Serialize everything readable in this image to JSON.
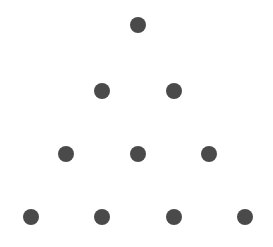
{
  "diagram": {
    "type": "triangular-dot-pattern",
    "rows": 4,
    "total_dots": 10,
    "dot_color": "#4a4a4a",
    "background": "#ffffff",
    "dot_diameter": 16,
    "dots": [
      {
        "row": 1,
        "x": 138,
        "y": 25
      },
      {
        "row": 2,
        "x": 102,
        "y": 91
      },
      {
        "row": 2,
        "x": 174,
        "y": 91
      },
      {
        "row": 3,
        "x": 66,
        "y": 154
      },
      {
        "row": 3,
        "x": 138,
        "y": 154
      },
      {
        "row": 3,
        "x": 209,
        "y": 154
      },
      {
        "row": 4,
        "x": 31,
        "y": 217
      },
      {
        "row": 4,
        "x": 102,
        "y": 217
      },
      {
        "row": 4,
        "x": 174,
        "y": 217
      },
      {
        "row": 4,
        "x": 245,
        "y": 217
      }
    ]
  }
}
